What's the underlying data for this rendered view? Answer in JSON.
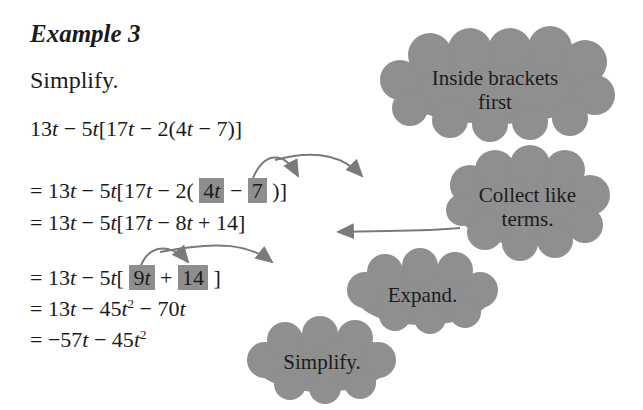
{
  "example": {
    "title": "Example 3",
    "prompt": "Simplify."
  },
  "steps": [
    {
      "parts": [
        "13",
        "t",
        " − 5",
        "t",
        "[17",
        "t",
        " − 2(4",
        "t",
        " − 7)]"
      ]
    },
    {
      "prefix": "= 13",
      "t1": "t",
      "mid": " − 5",
      "t2": "t",
      "mid2": "[17",
      "t3": "t",
      "mid3": " − 2( ",
      "box1": "4",
      "box1_var": "t",
      "op": " − ",
      "box2": "7",
      "suffix": " )]"
    },
    {
      "prefix": "= 13",
      "t1": "t",
      "mid": " − 5",
      "t2": "t",
      "mid2": "[17",
      "t3": "t",
      "mid3": " − 8",
      "t4": "t",
      "suffix": " + 14]"
    },
    {
      "prefix": "= 13",
      "t1": "t",
      "mid": " − 5",
      "t2": "t",
      "mid2": "[ ",
      "box1": "9",
      "box1_var": "t",
      "op": " + ",
      "box2": "14",
      "suffix": " ]"
    },
    {
      "prefix": "= 13",
      "t1": "t",
      "mid": " − 45",
      "t2": "t",
      "exp": "2",
      "mid2": " − 70",
      "t3": "t"
    },
    {
      "prefix": "= −57",
      "t1": "t",
      "mid": " − 45",
      "t2": "t",
      "exp": "2"
    }
  ],
  "callouts": [
    {
      "line1": "Inside brackets",
      "line2": "first"
    },
    {
      "line1": "Collect like",
      "line2": "terms."
    },
    {
      "line1": "Expand."
    },
    {
      "line1": "Simplify."
    }
  ],
  "colors": {
    "cloud": "#8f8f8f",
    "box": "#8e8e8e",
    "arrow": "#7a7a7a"
  }
}
